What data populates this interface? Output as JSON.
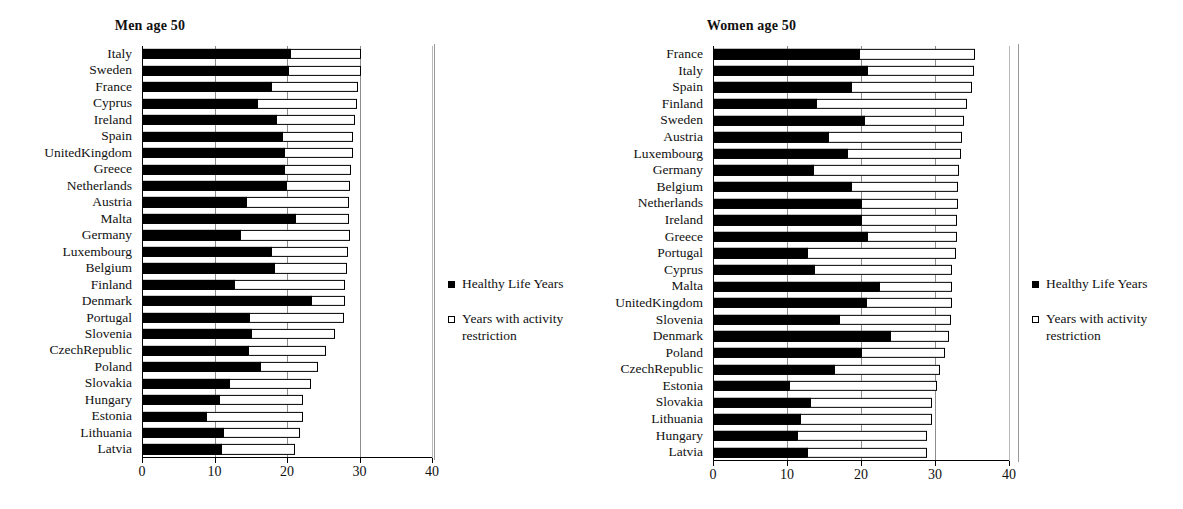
{
  "legend": {
    "healthy_label": "Healthy Life Years",
    "restriction_label": "Years with activity restriction",
    "healthy_color": "#000000",
    "restriction_color": "#ffffff"
  },
  "axis": {
    "ticks": [
      0,
      10,
      20,
      30,
      40
    ],
    "tick_labels": [
      "0",
      "10",
      "20",
      "30",
      "40"
    ],
    "xmin": 0,
    "xmax": 40
  },
  "chart_data": [
    {
      "type": "bar",
      "orientation": "horizontal",
      "stacked": true,
      "title": "Men age 50",
      "xlabel": "",
      "ylabel": "",
      "xlim": [
        0,
        40
      ],
      "grid": true,
      "legend_position": "right",
      "legend": [
        "Healthy Life Years",
        "Years with activity restriction"
      ],
      "categories": [
        "Italy",
        "Sweden",
        "France",
        "Cyprus",
        "Ireland",
        "Spain",
        "UnitedKingdom",
        "Greece",
        "Netherlands",
        "Austria",
        "Malta",
        "Germany",
        "Luxembourg",
        "Belgium",
        "Finland",
        "Denmark",
        "Portugal",
        "Slovenia",
        "CzechRepublic",
        "Poland",
        "Slovakia",
        "Hungary",
        "Estonia",
        "Lithuania",
        "Latvia"
      ],
      "series": [
        {
          "name": "Healthy Life Years",
          "values": [
            20.6,
            20.3,
            17.9,
            16.0,
            18.6,
            19.4,
            19.7,
            19.7,
            20.0,
            14.5,
            21.3,
            13.6,
            17.9,
            18.4,
            12.8,
            23.5,
            14.9,
            15.2,
            14.7,
            16.4,
            12.2,
            10.8,
            8.9,
            11.3,
            11.0
          ]
        },
        {
          "name": "Years with activity restriction",
          "values": [
            9.8,
            10.1,
            12.0,
            13.8,
            10.9,
            9.9,
            9.5,
            9.2,
            8.8,
            14.2,
            7.4,
            15.2,
            10.6,
            10.0,
            15.4,
            4.7,
            13.1,
            11.5,
            10.8,
            8.0,
            11.3,
            11.5,
            13.4,
            10.6,
            10.3
          ]
        }
      ],
      "totals": [
        30.4,
        30.4,
        29.9,
        29.8,
        29.5,
        29.3,
        29.2,
        28.9,
        28.8,
        28.7,
        28.7,
        28.8,
        28.5,
        28.4,
        28.2,
        28.2,
        28.0,
        26.7,
        25.5,
        24.4,
        23.5,
        22.3,
        22.3,
        21.9,
        21.3
      ]
    },
    {
      "type": "bar",
      "orientation": "horizontal",
      "stacked": true,
      "title": "Women age 50",
      "xlabel": "",
      "ylabel": "",
      "xlim": [
        0,
        40
      ],
      "grid": true,
      "legend_position": "right",
      "legend": [
        "Healthy Life Years",
        "Years with activity restriction"
      ],
      "categories": [
        "France",
        "Italy",
        "Spain",
        "Finland",
        "Sweden",
        "Austria",
        "Luxembourg",
        "Germany",
        "Belgium",
        "Netherlands",
        "Ireland",
        "Greece",
        "Portugal",
        "Cyprus",
        "Malta",
        "UnitedKingdom",
        "Slovenia",
        "Denmark",
        "Poland",
        "CzechRepublic",
        "Estonia",
        "Slovakia",
        "Lithuania",
        "Hungary",
        "Latvia"
      ],
      "series": [
        {
          "name": "Healthy Life Years",
          "values": [
            19.8,
            20.9,
            18.8,
            14.0,
            20.5,
            15.7,
            18.3,
            13.6,
            18.8,
            20.1,
            20.2,
            20.9,
            12.9,
            13.8,
            22.5,
            20.8,
            17.2,
            24.1,
            20.2,
            16.5,
            10.4,
            13.2,
            11.9,
            11.5,
            12.9
          ]
        },
        {
          "name": "Years with activity restriction",
          "values": [
            15.7,
            14.5,
            16.3,
            20.5,
            13.6,
            18.1,
            15.3,
            19.8,
            14.4,
            13.2,
            12.9,
            12.2,
            20.1,
            18.7,
            9.9,
            11.6,
            15.1,
            7.9,
            11.3,
            14.3,
            20.0,
            16.5,
            17.8,
            17.6,
            16.1
          ]
        }
      ],
      "totals": [
        35.5,
        35.4,
        35.1,
        34.5,
        34.1,
        33.8,
        33.6,
        33.4,
        33.2,
        33.3,
        33.1,
        33.1,
        33.0,
        32.5,
        32.4,
        32.4,
        32.3,
        32.0,
        31.5,
        30.8,
        30.4,
        29.7,
        29.7,
        29.1,
        29.0
      ]
    }
  ]
}
